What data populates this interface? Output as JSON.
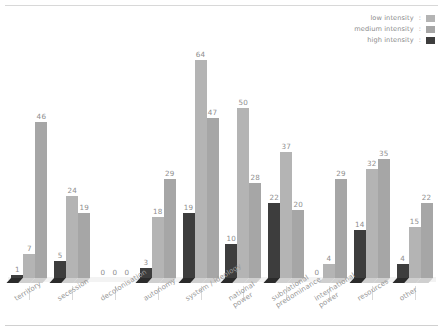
{
  "chart_data": {
    "type": "bar",
    "title": "",
    "subtitle": "",
    "xlabel": "",
    "ylabel": "",
    "grid": false,
    "ylim": [
      0,
      70
    ],
    "legend_position": "top-right",
    "orientation": "vertical-grouped-3d",
    "categories": [
      "territory",
      "secession",
      "decolonisation",
      "autonomy",
      "system / ideology",
      "national power",
      "subnational predominance",
      "international power",
      "resources",
      "other"
    ],
    "series": [
      {
        "name": "high intensity",
        "color": "#3d3d3d",
        "values": [
          1,
          5,
          0,
          3,
          19,
          10,
          22,
          0,
          14,
          4
        ]
      },
      {
        "name": "low intensity",
        "color": "#b4b4b4",
        "values": [
          7,
          24,
          0,
          18,
          64,
          50,
          37,
          4,
          32,
          15
        ]
      },
      {
        "name": "medium intensity",
        "color": "#a6a6a6",
        "values": [
          46,
          19,
          0,
          29,
          47,
          28,
          20,
          29,
          35,
          22
        ]
      }
    ],
    "legend": [
      {
        "label": "low intensity",
        "color": "#b4b4b4"
      },
      {
        "label": "medium intensity",
        "color": "#a6a6a6"
      },
      {
        "label": "high intensity",
        "color": "#3d3d3d"
      }
    ],
    "value_labels": [
      {
        "category": "territory",
        "values": [
          1,
          7,
          46
        ]
      },
      {
        "category": "secession",
        "values": [
          5,
          24,
          19
        ]
      },
      {
        "category": "decolonisation",
        "values": [
          0,
          0,
          0
        ]
      },
      {
        "category": "autonomy",
        "values": [
          3,
          18,
          29
        ]
      },
      {
        "category": "system / ideology",
        "values": [
          19,
          64,
          47
        ]
      },
      {
        "category": "national power",
        "values": [
          10,
          50,
          28
        ]
      },
      {
        "category": "subnational predominance",
        "values": [
          22,
          37,
          20
        ]
      },
      {
        "category": "international power",
        "values": [
          0,
          4,
          29
        ]
      },
      {
        "category": "resources",
        "values": [
          14,
          32,
          35
        ]
      },
      {
        "category": "other",
        "values": [
          4,
          15,
          22
        ]
      }
    ],
    "colors": {
      "background": "#ffffff",
      "dark_bar": "#3d3d3d",
      "light_bar": "#b4b4b4",
      "medium_bar": "#a6a6a6",
      "label_text": "#8e8e8e",
      "axis_line": "#d9d9d9",
      "rule": "#d8d8d8"
    }
  },
  "legend": {
    "colon": ":",
    "rows": [
      {
        "label": "low intensity",
        "color": "#b4b4b4",
        "name": "legend-low-intensity"
      },
      {
        "label": "medium intensity",
        "color": "#a6a6a6",
        "name": "legend-medium-intensity"
      },
      {
        "label": "high intensity",
        "color": "#3d3d3d",
        "name": "legend-high-intensity"
      }
    ]
  },
  "axis": {
    "labels": [
      {
        "text": "territory",
        "lines": [
          "territory"
        ]
      },
      {
        "text": "secession",
        "lines": [
          "secession"
        ]
      },
      {
        "text": "decolonisation",
        "lines": [
          "decolonisation"
        ]
      },
      {
        "text": "autonomy",
        "lines": [
          "autonomy"
        ]
      },
      {
        "text": "system / ideology",
        "lines": [
          "system / ideology"
        ]
      },
      {
        "text": "national power",
        "lines": [
          "national",
          "power"
        ]
      },
      {
        "text": "subnational predominance",
        "lines": [
          "subnational",
          "predominance"
        ]
      },
      {
        "text": "international power",
        "lines": [
          "international",
          "power"
        ]
      },
      {
        "text": "resources",
        "lines": [
          "resources"
        ]
      },
      {
        "text": "other",
        "lines": [
          "other"
        ]
      }
    ]
  }
}
